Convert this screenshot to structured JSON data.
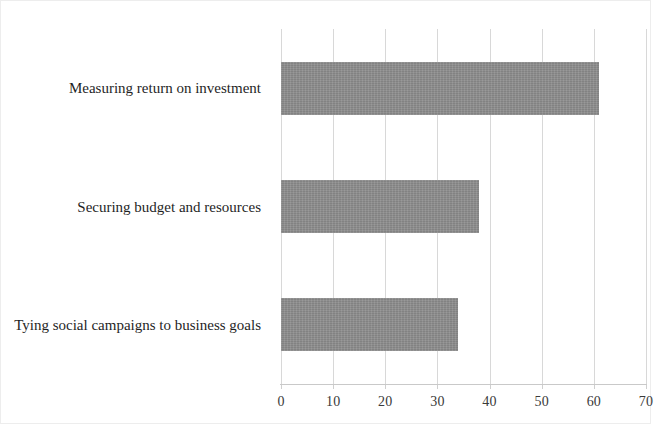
{
  "chart_data": {
    "type": "bar",
    "orientation": "horizontal",
    "title": "",
    "subtitle": "",
    "xlabel": "",
    "ylabel": "",
    "categories": [
      "Measuring return on investment",
      "Securing budget and resources",
      "Tying social campaigns to business goals"
    ],
    "values": [
      61,
      38,
      34
    ],
    "series": [
      {
        "name": "Percent of respondents",
        "values": [
          61,
          38,
          34
        ]
      }
    ],
    "xlim": [
      0,
      70
    ],
    "xticks": [
      0,
      10,
      20,
      30,
      40,
      50,
      60,
      70
    ],
    "xtick_labels": [
      "0",
      "10",
      "20",
      "30",
      "40",
      "50",
      "60",
      "70"
    ],
    "grid": "vertical",
    "legend": "none",
    "bar_color": "#8d8d8d",
    "gridline_color": "#d8d8d8",
    "axis_color": "#c9c9c9",
    "background": "#ffffff"
  }
}
